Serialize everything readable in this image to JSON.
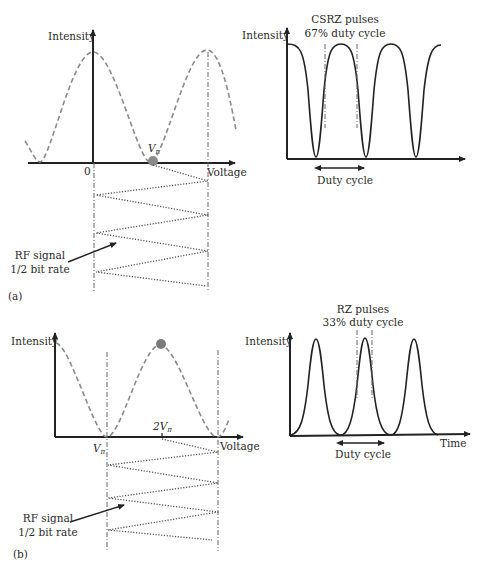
{
  "figure": {
    "panel_a": {
      "tag": "(a)",
      "transfer_plot": {
        "y_label": "Intensity",
        "x_label": "Voltage",
        "origin_label": "0",
        "bias_label_main": "V",
        "bias_label_sub": "π",
        "bias_point": "Vπ (null)"
      },
      "rf_label_line1": "RF signal",
      "rf_label_line2": "1/2 bit rate",
      "output_plot": {
        "y_label": "Intensity",
        "title_line1": "CSRZ pulses",
        "title_line2": "67% duty cycle",
        "duty_label": "Duty cycle"
      }
    },
    "panel_b": {
      "tag": "(b)",
      "transfer_plot": {
        "y_label": "Intensity",
        "x_label": "Voltage",
        "vpi_main": "V",
        "vpi_sub": "π",
        "two_vpi_main": "2V",
        "two_vpi_sub": "π",
        "bias_point": "peak"
      },
      "rf_label_line1": "RF signal",
      "rf_label_line2": "1/2 bit rate",
      "output_plot": {
        "y_label": "Intensity",
        "x_label": "Time",
        "title_line1": "RZ pulses",
        "title_line2": "33% duty cycle",
        "duty_label": "Duty cycle"
      }
    },
    "colors": {
      "axis": "#222222",
      "transfer_curve": "#8a8a8a",
      "bias_dot": "#7a7a7a",
      "rf_signal": "#555555"
    }
  }
}
